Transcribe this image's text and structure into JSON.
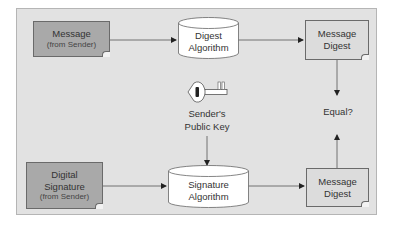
{
  "diagram": {
    "nodes": {
      "message": {
        "line1": "Message",
        "line2": "(from Sender)"
      },
      "digest_algorithm": {
        "line1": "Digest",
        "line2": "Algorithm"
      },
      "message_digest_top": {
        "line1": "Message",
        "line2": "Digest"
      },
      "public_key": {
        "line1": "Sender's",
        "line2": "Public Key",
        "icon": "key-icon"
      },
      "equal": {
        "label": "Equal?"
      },
      "digital_signature": {
        "line1": "Digital",
        "line2": "Signature",
        "line3": "(from Sender)"
      },
      "signature_algorithm": {
        "line1": "Signature",
        "line2": "Algorithm"
      },
      "message_digest_bottom": {
        "line1": "Message",
        "line2": "Digest"
      }
    },
    "edges": [
      {
        "from": "message",
        "to": "digest_algorithm"
      },
      {
        "from": "digest_algorithm",
        "to": "message_digest_top"
      },
      {
        "from": "message_digest_top",
        "to": "equal"
      },
      {
        "from": "public_key",
        "to": "signature_algorithm"
      },
      {
        "from": "digital_signature",
        "to": "signature_algorithm"
      },
      {
        "from": "signature_algorithm",
        "to": "message_digest_bottom"
      },
      {
        "from": "message_digest_bottom",
        "to": "equal"
      }
    ],
    "colors": {
      "frame_bg": "#e2e2e2",
      "sender_doc_bg": "#a9a9a9",
      "digest_doc_bg": "#dcdcdc",
      "cylinder_bg": "#ffffff",
      "line": "#333333"
    }
  }
}
